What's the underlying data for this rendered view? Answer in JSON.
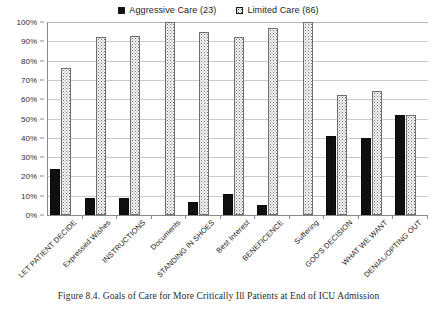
{
  "chart_data": {
    "type": "bar",
    "title": "",
    "xlabel": "",
    "ylabel": "",
    "ylim": [
      0,
      100
    ],
    "y_unit": "%",
    "grid": true,
    "legend_position": "top-center",
    "y_ticks": [
      "0%",
      "10%",
      "20%",
      "30%",
      "40%",
      "50%",
      "60%",
      "70%",
      "80%",
      "90%",
      "100%"
    ],
    "y_tick_values": [
      0,
      10,
      20,
      30,
      40,
      50,
      60,
      70,
      80,
      90,
      100
    ],
    "categories": [
      "LET PATIENT DECIDE",
      "Expressed Wishes",
      "INSTRUCTIONS",
      "Documents",
      "STANDING IN SHOES",
      "Best Interest",
      "BENEFICENCE",
      "Suffering",
      "GOD'S DECISION",
      "WHAT WE WANT",
      "DENIAL/OPTING OUT"
    ],
    "series": [
      {
        "name": "Aggressive Care (23)",
        "color": "#101010",
        "pattern": "solid",
        "values": [
          24,
          9,
          9,
          0,
          7,
          11,
          5,
          0,
          41,
          40,
          52
        ]
      },
      {
        "name": "Limited Care (86)",
        "color": "#fcfcfc",
        "pattern": "dotted",
        "values": [
          76,
          92,
          93,
          100,
          95,
          92,
          97,
          100,
          62,
          64,
          52
        ]
      }
    ]
  },
  "legend": {
    "entries": [
      {
        "label": "Aggressive Care (23)"
      },
      {
        "label": "Limited Care (86)"
      }
    ]
  },
  "caption": {
    "text": "Figure 8.4. Goals of Care for More Critically Ill Patients at End of ICU Admission"
  }
}
